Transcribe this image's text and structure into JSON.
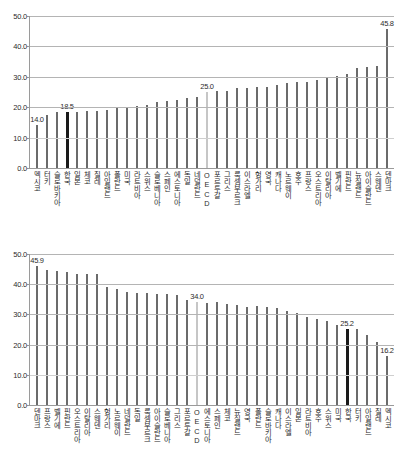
{
  "chart_data": [
    {
      "id": "top",
      "type": "bar",
      "title": "",
      "xlabel": "",
      "ylabel": "",
      "ylim": [
        0.0,
        50.0
      ],
      "yticks": [
        "0.0",
        "10.0",
        "20.0",
        "30.0",
        "40.0",
        "50.0"
      ],
      "grid": true,
      "legend": "none",
      "highlight_color_korea": "#1a1a1a",
      "highlight_color_oecd": "#c6c6c6",
      "bar_color": "#6b6b6b",
      "categories": [
        "멕시코",
        "터키",
        "슬로바키아",
        "한국",
        "일본",
        "체코",
        "칠레",
        "아일랜드",
        "폴란드",
        "미국",
        "라트비아",
        "스위스",
        "슬로베니아",
        "스페인",
        "에스토니아",
        "독일",
        "네덜란드",
        "OECD",
        "포르투갈",
        "그리스",
        "룩셈부르크",
        "이스라엘",
        "헝가리",
        "영국",
        "캐나다",
        "노르웨이",
        "호주",
        "프랑스",
        "오스트리아",
        "이탈리아",
        "벨기에",
        "핀란드",
        "뉴질랜드",
        "아이슬란드",
        "스웨덴",
        "덴마크"
      ],
      "values": [
        14.0,
        17.3,
        18.3,
        18.5,
        18.4,
        18.9,
        18.9,
        19.0,
        20.0,
        20.0,
        20.5,
        20.9,
        21.7,
        22.2,
        22.5,
        23.2,
        23.4,
        25.0,
        25.4,
        25.5,
        26.2,
        26.2,
        26.5,
        26.5,
        27.2,
        27.9,
        28.2,
        28.4,
        28.9,
        30.0,
        30.4,
        31.1,
        32.9,
        33.2,
        33.6,
        45.8
      ],
      "data_labels": [
        {
          "category": "멕시코",
          "text": "14.0"
        },
        {
          "category": "한국",
          "text": "18.5"
        },
        {
          "category": "OECD",
          "text": "25.0"
        },
        {
          "category": "덴마크",
          "text": "45.8"
        }
      ]
    },
    {
      "id": "bottom",
      "type": "bar",
      "title": "",
      "xlabel": "",
      "ylabel": "",
      "ylim": [
        0.0,
        50.0
      ],
      "yticks": [
        "0.0",
        "10.0",
        "20.0",
        "30.0",
        "40.0",
        "50.0"
      ],
      "grid": true,
      "legend": "none",
      "highlight_color_korea": "#1a1a1a",
      "highlight_color_oecd": "#c6c6c6",
      "bar_color": "#6b6b6b",
      "categories": [
        "덴마크",
        "프랑스",
        "벨기에",
        "핀란드",
        "오스트리아",
        "이탈리아",
        "스웨덴",
        "헝가리",
        "노르웨이",
        "네덜란드",
        "독일",
        "룩셈부르크",
        "아이슬란드",
        "슬로베니아",
        "그리스",
        "포르투갈",
        "OECD",
        "에스토니아",
        "스페인",
        "체코",
        "뉴질랜드",
        "영국",
        "폴란드",
        "슬로바키아",
        "캐나다",
        "이스라엘",
        "일본",
        "라트비아",
        "호주",
        "스위스",
        "미국",
        "한국",
        "터키",
        "아일랜드",
        "칠레",
        "멕시코"
      ],
      "values": [
        45.9,
        44.6,
        44.4,
        43.9,
        43.5,
        43.3,
        43.3,
        39.0,
        38.3,
        37.5,
        37.0,
        37.0,
        36.8,
        36.9,
        36.5,
        34.8,
        34.0,
        33.9,
        34.0,
        33.5,
        33.1,
        32.6,
        32.7,
        32.5,
        32.3,
        31.3,
        30.5,
        29.2,
        28.4,
        27.8,
        26.5,
        25.2,
        25.1,
        23.3,
        20.9,
        16.2
      ],
      "data_labels": [
        {
          "category": "덴마크",
          "text": "45.9"
        },
        {
          "category": "OECD",
          "text": "34.0"
        },
        {
          "category": "한국",
          "text": "25.2"
        },
        {
          "category": "멕시코",
          "text": "16.2"
        }
      ]
    }
  ]
}
